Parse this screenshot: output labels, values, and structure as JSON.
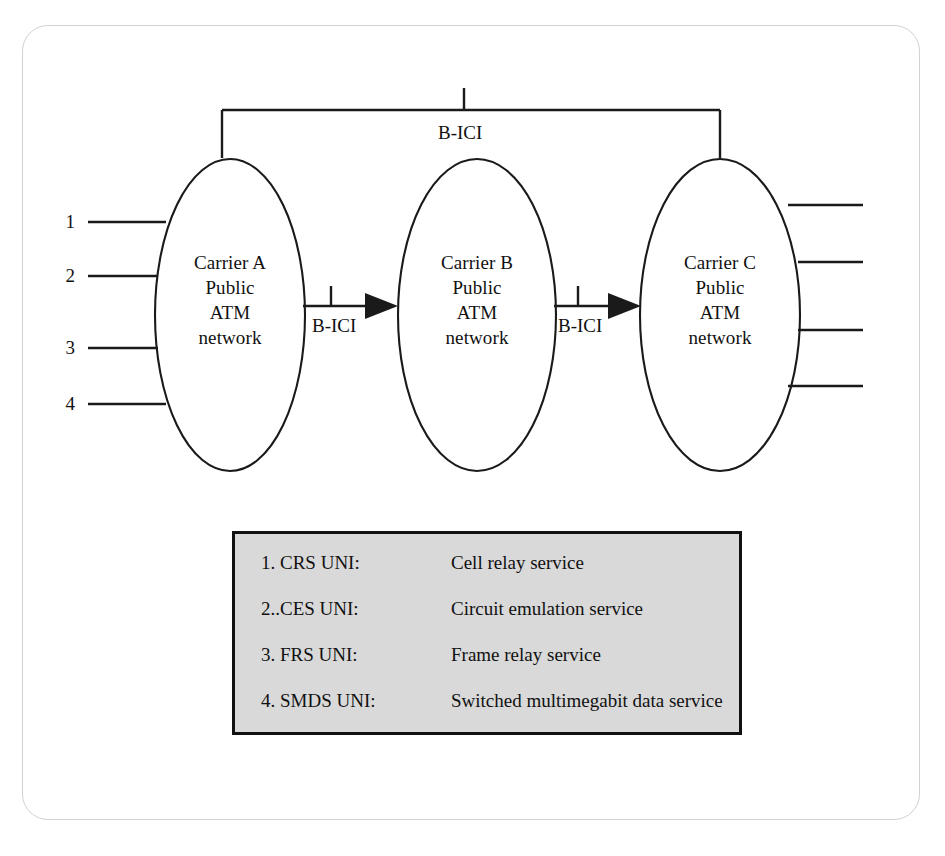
{
  "diagram": {
    "top_bracket_label": "B-ICI",
    "nodes": [
      {
        "id": "carrier-a",
        "lines": [
          "Carrier A",
          "Public",
          "ATM",
          "network"
        ],
        "line1": "Carrier A",
        "line2": "Public",
        "line3": "ATM",
        "line4": "network"
      },
      {
        "id": "carrier-b",
        "lines": [
          "Carrier B",
          "Public",
          "ATM",
          "network"
        ],
        "line1": "Carrier B",
        "line2": "Public",
        "line3": "ATM",
        "line4": "network"
      },
      {
        "id": "carrier-c",
        "lines": [
          "Carrier C",
          "Public",
          "ATM",
          "network"
        ],
        "line1": "Carrier C",
        "line2": "Public",
        "line3": "ATM",
        "line4": "network"
      }
    ],
    "edges": [
      {
        "id": "a-to-b",
        "label": "B-ICI",
        "from": "carrier-a",
        "to": "carrier-b",
        "arrow": true
      },
      {
        "id": "b-to-c",
        "label": "B-ICI",
        "from": "carrier-b",
        "to": "carrier-c",
        "arrow": true
      },
      {
        "id": "a-to-c-bracket",
        "label": "B-ICI",
        "from": "carrier-a",
        "to": "carrier-c",
        "arrow": false
      }
    ],
    "left_ports": [
      {
        "number": "1"
      },
      {
        "number": "2"
      },
      {
        "number": "3"
      },
      {
        "number": "4"
      }
    ],
    "right_ports": [
      {
        "number": ""
      },
      {
        "number": ""
      },
      {
        "number": ""
      },
      {
        "number": ""
      }
    ],
    "colors": {
      "stroke": "#1a1a1a",
      "frame": "#d2d2d2",
      "legend_fill": "#d9d9d9",
      "legend_border": "#111111",
      "text": "#111111"
    }
  },
  "legend": {
    "rows": [
      {
        "key": "1. CRS UNI:",
        "value": "Cell relay service"
      },
      {
        "key": "2..CES UNI:",
        "value": "Circuit emulation service"
      },
      {
        "key": "3. FRS UNI:",
        "value": "Frame relay service"
      },
      {
        "key": "4. SMDS UNI:",
        "value": "Switched multimegabit data service"
      }
    ]
  }
}
